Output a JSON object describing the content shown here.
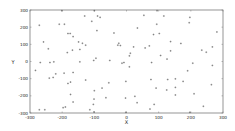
{
  "chart_data": {
    "type": "scatter",
    "title": "",
    "xlabel": "X",
    "ylabel": "Y",
    "xlim": [
      -300,
      300
    ],
    "ylim": [
      -300,
      300
    ],
    "xticks": [
      -300,
      -200,
      -100,
      0,
      100,
      200,
      300
    ],
    "yticks": [
      -300,
      -200,
      -100,
      0,
      100,
      200,
      300
    ],
    "grid": false,
    "legend": null,
    "marker": "+",
    "colors": {
      "frame": "#7a7a7a",
      "marker": "#555555",
      "text": "#222222"
    },
    "series": [
      {
        "name": "points",
        "points": [
          [
            -201,
            296
          ],
          [
            -100,
            296
          ],
          [
            -271,
            211
          ],
          [
            -209,
            217
          ],
          [
            -193,
            217
          ],
          [
            -130,
            265
          ],
          [
            -108,
            234
          ],
          [
            -90,
            265
          ],
          [
            -82,
            257
          ],
          [
            -182,
            163
          ],
          [
            -175,
            163
          ],
          [
            -166,
            145
          ],
          [
            -92,
            180
          ],
          [
            -258,
            114
          ],
          [
            -149,
            114
          ],
          [
            -137,
            106
          ],
          [
            -127,
            95
          ],
          [
            -243,
            74
          ],
          [
            -145,
            70
          ],
          [
            -168,
            66
          ],
          [
            -184,
            52
          ],
          [
            -39,
            166
          ],
          [
            34,
            195
          ],
          [
            54,
            269
          ],
          [
            95,
            296
          ],
          [
            116,
            265
          ],
          [
            94,
            217
          ],
          [
            102,
            163
          ],
          [
            84,
            157
          ],
          [
            197,
            257
          ],
          [
            195,
            226
          ],
          [
            281,
            172
          ],
          [
            -24,
            106
          ],
          [
            -19,
            93
          ],
          [
            -27,
            95
          ],
          [
            22,
            85
          ],
          [
            71,
            91
          ],
          [
            58,
            79
          ],
          [
            137,
            116
          ],
          [
            169,
            105
          ],
          [
            137,
            62
          ],
          [
            234,
            66
          ],
          [
            248,
            54
          ],
          [
            267,
            85
          ],
          [
            -268,
            -6
          ],
          [
            -238,
            -6
          ],
          [
            -226,
            -2
          ],
          [
            -145,
            -2
          ],
          [
            -102,
            6
          ],
          [
            -95,
            19
          ],
          [
            -52,
            6
          ],
          [
            -14,
            -10
          ],
          [
            -8,
            -6
          ],
          [
            9,
            33
          ],
          [
            12,
            48
          ],
          [
            9,
            -31
          ],
          [
            78,
            -6
          ],
          [
            126,
            14
          ],
          [
            106,
            35
          ],
          [
            206,
            -10
          ],
          [
            190,
            -54
          ],
          [
            267,
            -23
          ],
          [
            -283,
            -52
          ],
          [
            -220,
            -72
          ],
          [
            -194,
            -68
          ],
          [
            -166,
            -64
          ],
          [
            -240,
            -97
          ],
          [
            -228,
            -93
          ],
          [
            -127,
            -108
          ],
          [
            -174,
            -120
          ],
          [
            -182,
            -128
          ],
          [
            -2,
            -116
          ],
          [
            76,
            -105
          ],
          [
            128,
            -105
          ],
          [
            152,
            -101
          ],
          [
            176,
            -116
          ],
          [
            -55,
            -124
          ],
          [
            -76,
            -155
          ],
          [
            -100,
            -170
          ],
          [
            92,
            -155
          ],
          [
            152,
            -151
          ],
          [
            125,
            -166
          ],
          [
            264,
            -135
          ],
          [
            210,
            -188
          ],
          [
            -174,
            -192
          ],
          [
            -64,
            -211
          ],
          [
            -101,
            -219
          ],
          [
            -3,
            -213
          ],
          [
            26,
            -203
          ],
          [
            152,
            -195
          ],
          [
            -166,
            -236
          ],
          [
            33,
            -240
          ],
          [
            -190,
            -265
          ],
          [
            -197,
            -269
          ],
          [
            -103,
            -250
          ],
          [
            86,
            -250
          ],
          [
            239,
            -261
          ],
          [
            -271,
            -281
          ],
          [
            -254,
            -281
          ],
          [
            -114,
            -281
          ],
          [
            -101,
            -294
          ],
          [
            73,
            -277
          ],
          [
            -2,
            -296
          ],
          [
            197,
            -296
          ]
        ]
      }
    ]
  }
}
